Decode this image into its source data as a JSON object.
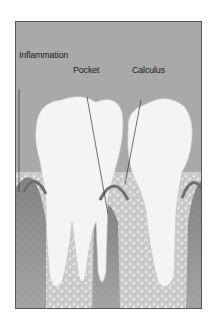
{
  "diagram": {
    "labels": {
      "inflammation": "Inflammation",
      "pocket": "Pocket",
      "calculus": "Calculus"
    },
    "colors": {
      "background": "#a9a9a9",
      "tooth": "#f4f4f4",
      "gum": "#8c8c8c",
      "bone": "#cfcfcf",
      "border": "#555555"
    }
  }
}
